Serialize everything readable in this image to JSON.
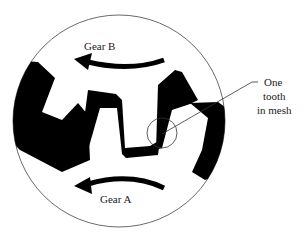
{
  "diagram": {
    "labels": {
      "gear_b": "Gear B",
      "gear_a": "Gear A",
      "callout_line1": "One",
      "callout_line2": "tooth",
      "callout_line3": "in mesh"
    },
    "colors": {
      "fill": "#000000",
      "stroke": "#444444",
      "background": "#ffffff"
    }
  }
}
